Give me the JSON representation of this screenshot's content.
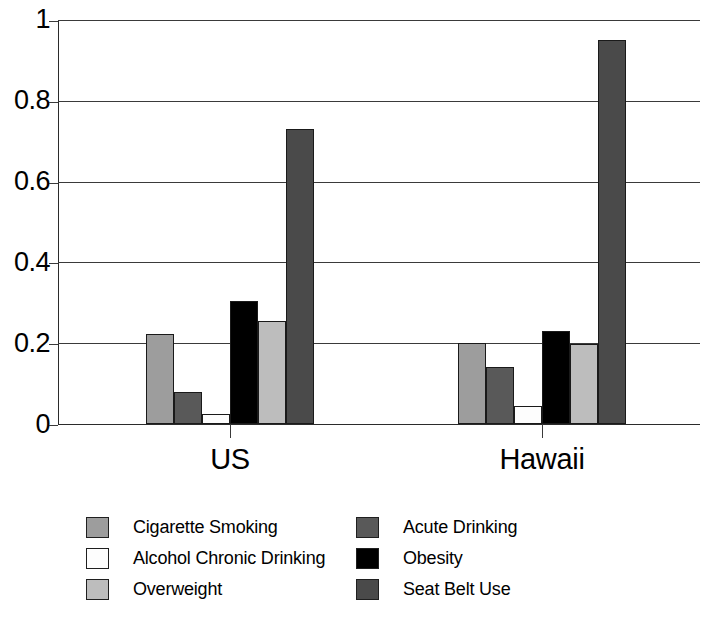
{
  "chart_data": {
    "type": "bar",
    "title": "",
    "subtitle": "",
    "xlabel": "",
    "ylabel": "",
    "categories": [
      "US",
      "Hawaii"
    ],
    "ylim": [
      0,
      1
    ],
    "y_ticks": [
      0,
      0.2,
      0.4,
      0.6,
      0.8,
      1
    ],
    "y_tick_labels": [
      "0",
      "0.2",
      "0.4",
      "0.6",
      "0.8",
      "1"
    ],
    "grid": "horizontal",
    "legend_position": "bottom",
    "legend_columns": 2,
    "series": [
      {
        "name": "Cigarette Smoking",
        "key": "cigarette",
        "color": "#9d9d9d",
        "values": [
          0.222,
          0.2
        ]
      },
      {
        "name": "Acute Drinking",
        "key": "acute",
        "color": "#595959",
        "values": [
          0.08,
          0.14
        ]
      },
      {
        "name": "Alcohol Chronic Drinking",
        "key": "alcohol",
        "color": "#fdfdfd",
        "values": [
          0.025,
          0.045
        ]
      },
      {
        "name": "Obesity",
        "key": "obesity",
        "color": "#000000",
        "values": [
          0.305,
          0.23
        ]
      },
      {
        "name": "Overweight",
        "key": "overweight",
        "color": "#bdbdbd",
        "values": [
          0.255,
          0.197
        ]
      },
      {
        "name": "Seat Belt Use",
        "key": "seatbelt",
        "color": "#4a4a4a",
        "values": [
          0.73,
          0.95
        ]
      }
    ]
  },
  "axis": {
    "y_tick_labels": [
      "1",
      "0.8",
      "0.6",
      "0.4",
      "0.2",
      "0"
    ],
    "category_labels": [
      "US",
      "Hawaii"
    ]
  },
  "legend": {
    "left_column": [
      "Cigarette Smoking",
      "Alcohol Chronic Drinking",
      "Overweight"
    ],
    "right_column": [
      "Acute Drinking",
      "Obesity",
      "Seat Belt Use"
    ]
  }
}
